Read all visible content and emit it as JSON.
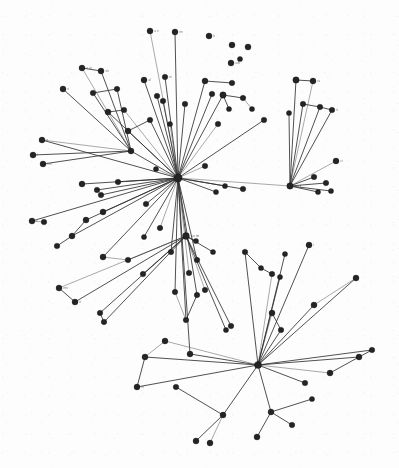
{
  "figure": {
    "width": 399,
    "height": 468,
    "background_color": "#ffffff",
    "node_color": "#1c1c1c",
    "edge_color": "#2b2b2b",
    "label_color": "#4a4a4a"
  },
  "chart_data": {
    "type": "network",
    "title": "",
    "xlabel": "",
    "ylabel": "",
    "grid": false,
    "legend": "none",
    "xlim": [
      0,
      399
    ],
    "ylim": [
      0,
      468
    ],
    "layout": "force-directed radial",
    "node_count": 112,
    "edge_count": 119,
    "hubs": [
      {
        "id": "h1",
        "x": 178,
        "y": 178,
        "degree": 44,
        "label": ""
      },
      {
        "id": "h2",
        "x": 258,
        "y": 365,
        "degree": 16,
        "label": ""
      },
      {
        "id": "h3",
        "x": 186,
        "y": 236,
        "degree": 11,
        "label": ""
      },
      {
        "id": "h4",
        "x": 290,
        "y": 186,
        "degree": 10,
        "label": ""
      },
      {
        "id": "h5",
        "x": 131,
        "y": 151,
        "degree": 8,
        "label": ""
      }
    ],
    "nodes": [
      {
        "id": "n0",
        "x": 178,
        "y": 178,
        "r": 4.2,
        "label": ""
      },
      {
        "id": "n1",
        "x": 186,
        "y": 236,
        "r": 3.4,
        "label": "arc tm"
      },
      {
        "id": "n2",
        "x": 258,
        "y": 365,
        "r": 3.6,
        "label": ""
      },
      {
        "id": "n3",
        "x": 290,
        "y": 186,
        "r": 3.2,
        "label": "mu ti"
      },
      {
        "id": "n4",
        "x": 131,
        "y": 151,
        "r": 3.0,
        "label": ""
      },
      {
        "id": "n5",
        "x": 150,
        "y": 31,
        "r": 3.0,
        "label": "a n"
      },
      {
        "id": "n6",
        "x": 175,
        "y": 32,
        "r": 3.0,
        "label": "im"
      },
      {
        "id": "n7",
        "x": 209,
        "y": 36,
        "r": 3.0,
        "label": "h"
      },
      {
        "id": "n8",
        "x": 232,
        "y": 45,
        "r": 3.0,
        "label": ""
      },
      {
        "id": "n9",
        "x": 248,
        "y": 47,
        "r": 3.0,
        "label": ""
      },
      {
        "id": "n10",
        "x": 231,
        "y": 63,
        "r": 3.0,
        "label": "urb"
      },
      {
        "id": "n11",
        "x": 240,
        "y": 59,
        "r": 2.6,
        "label": ""
      },
      {
        "id": "n12",
        "x": 82,
        "y": 68,
        "r": 3.0,
        "label": "a ut"
      },
      {
        "id": "n13",
        "x": 101,
        "y": 71,
        "r": 3.0,
        "label": "sti"
      },
      {
        "id": "n14",
        "x": 63,
        "y": 89,
        "r": 3.0,
        "label": "ri"
      },
      {
        "id": "n15",
        "x": 93,
        "y": 93,
        "r": 2.8,
        "label": ""
      },
      {
        "id": "n16",
        "x": 117,
        "y": 89,
        "r": 2.8,
        "label": ""
      },
      {
        "id": "n17",
        "x": 144,
        "y": 80,
        "r": 3.0,
        "label": "al"
      },
      {
        "id": "n18",
        "x": 165,
        "y": 77,
        "r": 2.8,
        "label": "ni"
      },
      {
        "id": "n19",
        "x": 157,
        "y": 96,
        "r": 2.8,
        "label": ""
      },
      {
        "id": "n20",
        "x": 124,
        "y": 110,
        "r": 2.8,
        "label": ""
      },
      {
        "id": "n21",
        "x": 108,
        "y": 112,
        "r": 3.0,
        "label": ""
      },
      {
        "id": "n22",
        "x": 128,
        "y": 131,
        "r": 3.0,
        "label": ""
      },
      {
        "id": "n23",
        "x": 150,
        "y": 120,
        "r": 2.8,
        "label": ""
      },
      {
        "id": "n24",
        "x": 163,
        "y": 101,
        "r": 2.8,
        "label": ""
      },
      {
        "id": "n25",
        "x": 170,
        "y": 124,
        "r": 2.6,
        "label": ""
      },
      {
        "id": "n26",
        "x": 185,
        "y": 104,
        "r": 2.8,
        "label": ""
      },
      {
        "id": "n27",
        "x": 205,
        "y": 81,
        "r": 3.0,
        "label": ""
      },
      {
        "id": "n28",
        "x": 212,
        "y": 94,
        "r": 2.8,
        "label": ""
      },
      {
        "id": "n29",
        "x": 223,
        "y": 95,
        "r": 3.2,
        "label": ""
      },
      {
        "id": "n30",
        "x": 229,
        "y": 109,
        "r": 2.6,
        "label": ""
      },
      {
        "id": "n31",
        "x": 243,
        "y": 98,
        "r": 2.8,
        "label": ""
      },
      {
        "id": "n32",
        "x": 232,
        "y": 83,
        "r": 2.8,
        "label": ""
      },
      {
        "id": "n33",
        "x": 252,
        "y": 109,
        "r": 2.6,
        "label": ""
      },
      {
        "id": "n34",
        "x": 218,
        "y": 124,
        "r": 2.8,
        "label": ""
      },
      {
        "id": "n35",
        "x": 296,
        "y": 80,
        "r": 3.2,
        "label": ""
      },
      {
        "id": "n36",
        "x": 313,
        "y": 81,
        "r": 3.0,
        "label": "ra"
      },
      {
        "id": "n37",
        "x": 303,
        "y": 104,
        "r": 2.8,
        "label": ""
      },
      {
        "id": "n38",
        "x": 320,
        "y": 107,
        "r": 2.8,
        "label": ""
      },
      {
        "id": "n39",
        "x": 332,
        "y": 110,
        "r": 2.8,
        "label": "ti"
      },
      {
        "id": "n40",
        "x": 289,
        "y": 113,
        "r": 2.6,
        "label": ""
      },
      {
        "id": "n41",
        "x": 264,
        "y": 120,
        "r": 2.8,
        "label": ""
      },
      {
        "id": "n42",
        "x": 336,
        "y": 161,
        "r": 3.0,
        "label": "ci"
      },
      {
        "id": "n43",
        "x": 314,
        "y": 177,
        "r": 2.8,
        "label": ""
      },
      {
        "id": "n44",
        "x": 326,
        "y": 183,
        "r": 2.8,
        "label": ""
      },
      {
        "id": "n45",
        "x": 331,
        "y": 191,
        "r": 2.6,
        "label": ""
      },
      {
        "id": "n46",
        "x": 318,
        "y": 192,
        "r": 2.6,
        "label": ""
      },
      {
        "id": "n47",
        "x": 243,
        "y": 189,
        "r": 2.8,
        "label": ""
      },
      {
        "id": "n48",
        "x": 225,
        "y": 186,
        "r": 2.6,
        "label": ""
      },
      {
        "id": "n49",
        "x": 216,
        "y": 192,
        "r": 2.6,
        "label": ""
      },
      {
        "id": "n50",
        "x": 205,
        "y": 166,
        "r": 2.8,
        "label": ""
      },
      {
        "id": "n51",
        "x": 42,
        "y": 140,
        "r": 3.0,
        "label": "ri"
      },
      {
        "id": "n52",
        "x": 33,
        "y": 155,
        "r": 3.0,
        "label": "l"
      },
      {
        "id": "n53",
        "x": 43,
        "y": 164,
        "r": 3.0,
        "label": "nei"
      },
      {
        "id": "n54",
        "x": 82,
        "y": 184,
        "r": 3.0,
        "label": ""
      },
      {
        "id": "n55",
        "x": 97,
        "y": 190,
        "r": 2.8,
        "label": ""
      },
      {
        "id": "n56",
        "x": 101,
        "y": 195,
        "r": 2.8,
        "label": ""
      },
      {
        "id": "n57",
        "x": 118,
        "y": 182,
        "r": 2.8,
        "label": ""
      },
      {
        "id": "n58",
        "x": 156,
        "y": 169,
        "r": 2.6,
        "label": ""
      },
      {
        "id": "n59",
        "x": 32,
        "y": 221,
        "r": 3.0,
        "label": "r"
      },
      {
        "id": "n60",
        "x": 44,
        "y": 222,
        "r": 2.8,
        "label": ""
      },
      {
        "id": "n61",
        "x": 86,
        "y": 220,
        "r": 3.0,
        "label": ""
      },
      {
        "id": "n62",
        "x": 72,
        "y": 236,
        "r": 3.0,
        "label": ""
      },
      {
        "id": "n63",
        "x": 57,
        "y": 246,
        "r": 2.8,
        "label": ""
      },
      {
        "id": "n64",
        "x": 103,
        "y": 212,
        "r": 3.0,
        "label": ""
      },
      {
        "id": "n65",
        "x": 146,
        "y": 204,
        "r": 2.8,
        "label": ""
      },
      {
        "id": "n66",
        "x": 160,
        "y": 228,
        "r": 2.8,
        "label": ""
      },
      {
        "id": "n67",
        "x": 144,
        "y": 237,
        "r": 2.6,
        "label": ""
      },
      {
        "id": "n68",
        "x": 171,
        "y": 252,
        "r": 2.8,
        "label": ""
      },
      {
        "id": "n69",
        "x": 197,
        "y": 260,
        "r": 2.8,
        "label": ""
      },
      {
        "id": "n70",
        "x": 213,
        "y": 252,
        "r": 2.6,
        "label": ""
      },
      {
        "id": "n71",
        "x": 196,
        "y": 241,
        "r": 2.6,
        "label": ""
      },
      {
        "id": "n72",
        "x": 189,
        "y": 273,
        "r": 2.8,
        "label": ""
      },
      {
        "id": "n73",
        "x": 175,
        "y": 292,
        "r": 2.8,
        "label": ""
      },
      {
        "id": "n74",
        "x": 197,
        "y": 295,
        "r": 2.8,
        "label": ""
      },
      {
        "id": "n75",
        "x": 186,
        "y": 320,
        "r": 2.8,
        "label": ""
      },
      {
        "id": "n76",
        "x": 103,
        "y": 257,
        "r": 3.0,
        "label": ""
      },
      {
        "id": "n77",
        "x": 128,
        "y": 260,
        "r": 2.8,
        "label": ""
      },
      {
        "id": "n78",
        "x": 143,
        "y": 274,
        "r": 2.8,
        "label": ""
      },
      {
        "id": "n79",
        "x": 59,
        "y": 288,
        "r": 3.0,
        "label": "rmi"
      },
      {
        "id": "n80",
        "x": 75,
        "y": 302,
        "r": 3.0,
        "label": "it"
      },
      {
        "id": "n81",
        "x": 100,
        "y": 313,
        "r": 2.8,
        "label": ""
      },
      {
        "id": "n82",
        "x": 104,
        "y": 322,
        "r": 2.8,
        "label": ""
      },
      {
        "id": "n83",
        "x": 205,
        "y": 290,
        "r": 2.8,
        "label": ""
      },
      {
        "id": "n84",
        "x": 231,
        "y": 326,
        "r": 2.8,
        "label": ""
      },
      {
        "id": "n85",
        "x": 226,
        "y": 330,
        "r": 2.6,
        "label": ""
      },
      {
        "id": "n86",
        "x": 272,
        "y": 313,
        "r": 3.0,
        "label": ""
      },
      {
        "id": "n87",
        "x": 281,
        "y": 330,
        "r": 2.8,
        "label": ""
      },
      {
        "id": "n88",
        "x": 314,
        "y": 305,
        "r": 3.0,
        "label": ""
      },
      {
        "id": "n89",
        "x": 356,
        "y": 278,
        "r": 3.0,
        "label": ""
      },
      {
        "id": "n90",
        "x": 245,
        "y": 252,
        "r": 2.8,
        "label": ""
      },
      {
        "id": "n91",
        "x": 261,
        "y": 268,
        "r": 2.6,
        "label": ""
      },
      {
        "id": "n92",
        "x": 272,
        "y": 274,
        "r": 2.8,
        "label": ""
      },
      {
        "id": "n93",
        "x": 280,
        "y": 277,
        "r": 2.6,
        "label": ""
      },
      {
        "id": "n94",
        "x": 309,
        "y": 245,
        "r": 3.0,
        "label": "i"
      },
      {
        "id": "n95",
        "x": 285,
        "y": 254,
        "r": 2.6,
        "label": ""
      },
      {
        "id": "n96",
        "x": 190,
        "y": 354,
        "r": 3.0,
        "label": ""
      },
      {
        "id": "n97",
        "x": 165,
        "y": 341,
        "r": 3.0,
        "label": ""
      },
      {
        "id": "n98",
        "x": 145,
        "y": 357,
        "r": 3.0,
        "label": ""
      },
      {
        "id": "n99",
        "x": 137,
        "y": 387,
        "r": 3.0,
        "label": "rri"
      },
      {
        "id": "n100",
        "x": 176,
        "y": 387,
        "r": 2.8,
        "label": ""
      },
      {
        "id": "n101",
        "x": 223,
        "y": 415,
        "r": 3.0,
        "label": ""
      },
      {
        "id": "n102",
        "x": 196,
        "y": 441,
        "r": 3.0,
        "label": ""
      },
      {
        "id": "n103",
        "x": 210,
        "y": 443,
        "r": 3.0,
        "label": ""
      },
      {
        "id": "n104",
        "x": 257,
        "y": 437,
        "r": 3.0,
        "label": ""
      },
      {
        "id": "n105",
        "x": 271,
        "y": 412,
        "r": 3.0,
        "label": ""
      },
      {
        "id": "n106",
        "x": 292,
        "y": 425,
        "r": 2.8,
        "label": ""
      },
      {
        "id": "n107",
        "x": 312,
        "y": 399,
        "r": 2.6,
        "label": ""
      },
      {
        "id": "n108",
        "x": 330,
        "y": 373,
        "r": 3.0,
        "label": ""
      },
      {
        "id": "n109",
        "x": 359,
        "y": 357,
        "r": 3.0,
        "label": ""
      },
      {
        "id": "n110",
        "x": 372,
        "y": 350,
        "r": 2.8,
        "label": ""
      },
      {
        "id": "n111",
        "x": 305,
        "y": 383,
        "r": 2.8,
        "label": ""
      }
    ],
    "edges": [
      [
        "n0",
        "n5"
      ],
      [
        "n0",
        "n6"
      ],
      [
        "n0",
        "n17"
      ],
      [
        "n0",
        "n18"
      ],
      [
        "n0",
        "n19"
      ],
      [
        "n0",
        "n20"
      ],
      [
        "n0",
        "n21"
      ],
      [
        "n0",
        "n22"
      ],
      [
        "n0",
        "n23"
      ],
      [
        "n0",
        "n24"
      ],
      [
        "n0",
        "n25"
      ],
      [
        "n0",
        "n26"
      ],
      [
        "n0",
        "n27"
      ],
      [
        "n0",
        "n28"
      ],
      [
        "n0",
        "n29"
      ],
      [
        "n0",
        "n34"
      ],
      [
        "n0",
        "n41"
      ],
      [
        "n0",
        "n47"
      ],
      [
        "n0",
        "n48"
      ],
      [
        "n0",
        "n49"
      ],
      [
        "n0",
        "n50"
      ],
      [
        "n0",
        "n54"
      ],
      [
        "n0",
        "n55"
      ],
      [
        "n0",
        "n56"
      ],
      [
        "n0",
        "n57"
      ],
      [
        "n0",
        "n58"
      ],
      [
        "n0",
        "n61"
      ],
      [
        "n0",
        "n62"
      ],
      [
        "n0",
        "n64"
      ],
      [
        "n0",
        "n65"
      ],
      [
        "n0",
        "n66"
      ],
      [
        "n0",
        "n67"
      ],
      [
        "n0",
        "n1"
      ],
      [
        "n0",
        "n68"
      ],
      [
        "n0",
        "n69"
      ],
      [
        "n0",
        "n72"
      ],
      [
        "n0",
        "n73"
      ],
      [
        "n0",
        "n74"
      ],
      [
        "n0",
        "n75"
      ],
      [
        "n0",
        "n76"
      ],
      [
        "n0",
        "n3"
      ],
      [
        "n0",
        "n4"
      ],
      [
        "n0",
        "n51"
      ],
      [
        "n0",
        "n59"
      ],
      [
        "n0",
        "n96"
      ],
      [
        "n4",
        "n12"
      ],
      [
        "n4",
        "n13"
      ],
      [
        "n4",
        "n14"
      ],
      [
        "n4",
        "n15"
      ],
      [
        "n4",
        "n16"
      ],
      [
        "n4",
        "n51"
      ],
      [
        "n4",
        "n52"
      ],
      [
        "n4",
        "n53"
      ],
      [
        "n1",
        "n70"
      ],
      [
        "n1",
        "n71"
      ],
      [
        "n1",
        "n83"
      ],
      [
        "n1",
        "n84"
      ],
      [
        "n1",
        "n85"
      ],
      [
        "n1",
        "n77"
      ],
      [
        "n1",
        "n78"
      ],
      [
        "n1",
        "n79"
      ],
      [
        "n1",
        "n80"
      ],
      [
        "n1",
        "n81"
      ],
      [
        "n1",
        "n82"
      ],
      [
        "n3",
        "n35"
      ],
      [
        "n3",
        "n36"
      ],
      [
        "n3",
        "n37"
      ],
      [
        "n3",
        "n38"
      ],
      [
        "n3",
        "n39"
      ],
      [
        "n3",
        "n40"
      ],
      [
        "n3",
        "n42"
      ],
      [
        "n3",
        "n43"
      ],
      [
        "n3",
        "n44"
      ],
      [
        "n3",
        "n45"
      ],
      [
        "n3",
        "n46"
      ],
      [
        "n2",
        "n86"
      ],
      [
        "n2",
        "n87"
      ],
      [
        "n2",
        "n88"
      ],
      [
        "n2",
        "n89"
      ],
      [
        "n2",
        "n90"
      ],
      [
        "n2",
        "n92"
      ],
      [
        "n2",
        "n93"
      ],
      [
        "n2",
        "n94"
      ],
      [
        "n2",
        "n95"
      ],
      [
        "n2",
        "n96"
      ],
      [
        "n2",
        "n97"
      ],
      [
        "n2",
        "n98"
      ],
      [
        "n2",
        "n99"
      ],
      [
        "n2",
        "n101"
      ],
      [
        "n2",
        "n105"
      ],
      [
        "n2",
        "n108"
      ],
      [
        "n2",
        "n109"
      ],
      [
        "n2",
        "n110"
      ],
      [
        "n2",
        "n111"
      ],
      [
        "n101",
        "n102"
      ],
      [
        "n101",
        "n103"
      ],
      [
        "n101",
        "n100"
      ],
      [
        "n105",
        "n104"
      ],
      [
        "n105",
        "n106"
      ],
      [
        "n105",
        "n107"
      ],
      [
        "n97",
        "n98"
      ],
      [
        "n98",
        "n99"
      ],
      [
        "n27",
        "n32"
      ],
      [
        "n29",
        "n30"
      ],
      [
        "n29",
        "n31"
      ],
      [
        "n31",
        "n33"
      ],
      [
        "n35",
        "n36"
      ],
      [
        "n37",
        "n38"
      ],
      [
        "n38",
        "n39"
      ],
      [
        "n86",
        "n87"
      ],
      [
        "n88",
        "n89"
      ],
      [
        "n90",
        "n91"
      ],
      [
        "n91",
        "n92"
      ],
      [
        "n108",
        "n109"
      ],
      [
        "n109",
        "n110"
      ],
      [
        "n76",
        "n77"
      ],
      [
        "n79",
        "n80"
      ],
      [
        "n81",
        "n82"
      ],
      [
        "n61",
        "n62"
      ],
      [
        "n62",
        "n63"
      ],
      [
        "n59",
        "n60"
      ],
      [
        "n12",
        "n13"
      ],
      [
        "n15",
        "n16"
      ],
      [
        "n20",
        "n21"
      ],
      [
        "n22",
        "n23"
      ],
      [
        "n73",
        "n75"
      ],
      [
        "n74",
        "n75"
      ]
    ]
  }
}
